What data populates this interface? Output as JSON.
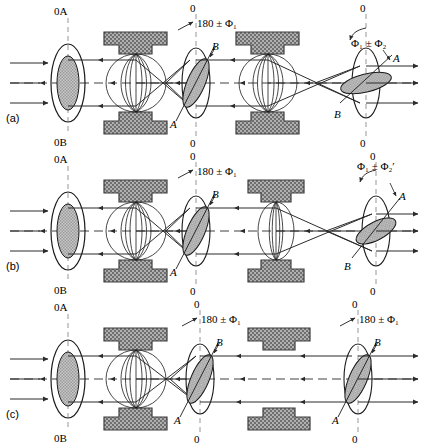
{
  "figure": {
    "axis_zero": "0",
    "axis_0A": "0A",
    "axis_0B": "0B",
    "label_A": "A",
    "label_B": "B"
  },
  "colors": {
    "ink": "#1a1a1a",
    "ray": "#2b2b2b",
    "pole_fill": "#9a9a9a",
    "pole_border": "#4a4a4a",
    "aperture_fill": "#b8b8b8",
    "axis_dash": "#8a8a8a"
  },
  "panels": [
    {
      "id": "a",
      "label": "(a)",
      "object": {
        "top_label": "0A",
        "bottom_label": "0B"
      },
      "lens1": {
        "state": "on",
        "strength": "strong"
      },
      "lens2": {
        "state": "on",
        "strength": "strong"
      },
      "intermediate_image": {
        "top_label": "0",
        "bottom_label": "0",
        "rotation_annotation": "180 ± Φ₁",
        "axis_A": "A",
        "axis_B": "B"
      },
      "final_image": {
        "top_label": "0",
        "bottom_label": "0",
        "rotation_annotation": "Φ₁ ± Φ₂",
        "axis_A": "A",
        "axis_B": "B"
      }
    },
    {
      "id": "b",
      "label": "(b)",
      "object": {
        "top_label": "0A",
        "bottom_label": "0B"
      },
      "lens1": {
        "state": "on",
        "strength": "strong"
      },
      "lens2": {
        "state": "on",
        "strength": "weak"
      },
      "intermediate_image": {
        "top_label": "0",
        "bottom_label": "0",
        "rotation_annotation": "180 ± Φ₁",
        "axis_A": "A",
        "axis_B": "B"
      },
      "final_image": {
        "top_label": "0",
        "bottom_label": "0",
        "rotation_annotation": "Φ₁ ± Φ₂′",
        "axis_A": "A",
        "axis_B": "B"
      }
    },
    {
      "id": "c",
      "label": "(c)",
      "object": {
        "top_label": "0A",
        "bottom_label": "0B"
      },
      "lens1": {
        "state": "on",
        "strength": "strong"
      },
      "lens2": {
        "state": "off",
        "strength": "none"
      },
      "intermediate_image": {
        "top_label": "0",
        "bottom_label": "0",
        "rotation_annotation": "180 ± Φ₁",
        "axis_A": "A",
        "axis_B": "B"
      },
      "final_image": {
        "top_label": "0",
        "bottom_label": "0",
        "rotation_annotation": "180 ± Φ₁",
        "axis_A": "A",
        "axis_B": "B"
      }
    }
  ]
}
